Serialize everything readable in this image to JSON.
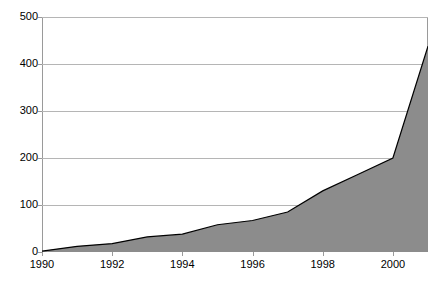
{
  "chart_data": {
    "type": "area",
    "title": "",
    "subtitle": "",
    "xlabel": "",
    "ylabel": "",
    "x": [
      1990,
      1991,
      1992,
      1993,
      1994,
      1995,
      1996,
      1997,
      1998,
      1999,
      2000,
      2001
    ],
    "values": [
      2,
      12,
      18,
      32,
      38,
      58,
      67,
      85,
      130,
      165,
      200,
      438
    ],
    "series": [
      {
        "name": "",
        "values": [
          2,
          12,
          18,
          32,
          38,
          58,
          67,
          85,
          130,
          165,
          200,
          438
        ]
      }
    ],
    "xlim": [
      1990,
      2001
    ],
    "ylim": [
      0,
      500
    ],
    "y_ticks": [
      0,
      100,
      200,
      300,
      400,
      500
    ],
    "y_tick_labels": [
      "0",
      "100",
      "200",
      "300",
      "400",
      "500"
    ],
    "x_ticks": [
      1990,
      1992,
      1994,
      1996,
      1998,
      2000
    ],
    "x_tick_labels": [
      "1990",
      "1992",
      "1994",
      "1996",
      "1998",
      "2000"
    ],
    "grid": "horizontal",
    "legend": "none",
    "area_fill_color": "#8c8c8c",
    "area_line_color": "#000000",
    "gridline_color": "#b5b5b5",
    "axis_color": "#9a9a9a",
    "background_color": "#ffffff",
    "annotations": []
  }
}
